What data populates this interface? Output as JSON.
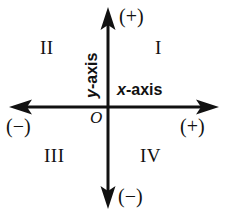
{
  "figure": {
    "background_color": "#ffffff",
    "ink_color": "#111111",
    "width": 229,
    "height": 216
  },
  "axes": {
    "origin": {
      "x": 108,
      "y": 107
    },
    "x_axis": {
      "label_var": "x",
      "label_rest": "-axis",
      "label_full": "x-axis",
      "start_x": 10,
      "end_x": 218,
      "positive_sign": "(+)",
      "negative_sign": "(−)"
    },
    "y_axis": {
      "label_var": "y",
      "label_rest": "-axis",
      "label_full": "y-axis",
      "start_y": 8,
      "end_y": 208,
      "positive_sign": "(+)",
      "negative_sign": "(−)"
    },
    "origin_label": "O",
    "line_width": 3,
    "arrowheads": [
      "up",
      "down",
      "left",
      "right"
    ]
  },
  "quadrants": [
    {
      "name": "quadrant-1",
      "label": "I",
      "position": "top-right"
    },
    {
      "name": "quadrant-2",
      "label": "II",
      "position": "top-left"
    },
    {
      "name": "quadrant-3",
      "label": "III",
      "position": "bottom-left"
    },
    {
      "name": "quadrant-4",
      "label": "IV",
      "position": "bottom-right"
    }
  ],
  "signs": {
    "top": "(+)",
    "right": "(+)",
    "left": "(−)",
    "bottom": "(−)"
  }
}
